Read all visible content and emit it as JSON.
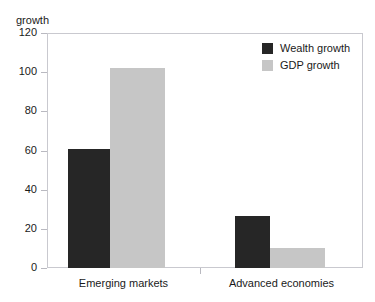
{
  "chart_data": {
    "type": "bar",
    "title": "",
    "xlabel": "",
    "ylabel": "growth",
    "ylim": [
      0,
      120
    ],
    "yticks": [
      0,
      20,
      40,
      60,
      80,
      100,
      120
    ],
    "grid": false,
    "legend_position": "top-right",
    "categories": [
      "Emerging markets",
      "Advanced economies"
    ],
    "series": [
      {
        "name": "Wealth growth",
        "color": "#262626",
        "values": [
          61,
          26.5
        ]
      },
      {
        "name": "GDP growth",
        "color": "#c6c6c6",
        "values": [
          102,
          10
        ]
      }
    ]
  },
  "axis": {
    "y_name": "growth",
    "tick_labels": [
      "0",
      "20",
      "40",
      "60",
      "80",
      "100",
      "120"
    ]
  },
  "colors": {
    "wealth_growth": "#262626",
    "gdp_growth": "#c6c6c6",
    "frame": "#c9c9cf",
    "text": "#1a1a1a",
    "background": "#ffffff"
  }
}
